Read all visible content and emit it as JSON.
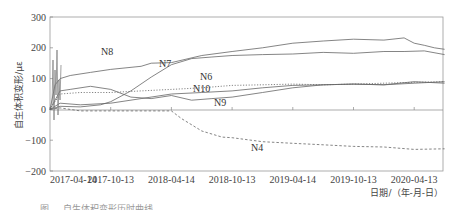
{
  "chart_data": {
    "type": "line",
    "title": "",
    "xlabel": "日期/（年-月-日）",
    "ylabel": "自生体积变形/με",
    "ylim": [
      -200,
      300
    ],
    "yticks": [
      300,
      200,
      100,
      0,
      -100,
      -200
    ],
    "xticks": [
      "2017-04-14",
      "2017-10-13",
      "2018-04-14",
      "2018-10-13",
      "2019-04-14",
      "2019-10-13",
      "2020-04-13"
    ],
    "grid": false,
    "legend": "inline labels",
    "x_unit": "months since 2017-04-14",
    "series": [
      {
        "name": "N8",
        "style": "solid",
        "x": [
          0,
          0.5,
          1,
          2,
          4,
          6,
          9,
          10,
          12,
          15,
          18,
          21,
          24,
          27,
          30,
          33,
          35,
          36,
          37,
          38,
          39
        ],
        "values": [
          0,
          80,
          100,
          110,
          120,
          130,
          140,
          150,
          152,
          175,
          188,
          200,
          215,
          222,
          228,
          225,
          232,
          215,
          208,
          200,
          195
        ]
      },
      {
        "name": "N7",
        "style": "solid",
        "x": [
          0,
          1,
          3,
          5,
          6,
          8,
          10,
          12,
          14,
          16,
          18,
          21,
          24,
          27,
          30,
          33,
          35,
          37,
          39
        ],
        "values": [
          0,
          10,
          8,
          15,
          25,
          60,
          105,
          145,
          165,
          170,
          175,
          178,
          180,
          185,
          182,
          188,
          188,
          190,
          178
        ]
      },
      {
        "name": "N6",
        "style": "dotted",
        "x": [
          0,
          1,
          3,
          6,
          9,
          12,
          15,
          18,
          21,
          24,
          27,
          30,
          33,
          36,
          39
        ],
        "values": [
          0,
          50,
          55,
          55,
          60,
          65,
          70,
          78,
          80,
          82,
          80,
          82,
          85,
          88,
          90
        ]
      },
      {
        "name": "N10",
        "style": "solid",
        "x": [
          0,
          1,
          2,
          4,
          6,
          8,
          10,
          12,
          14,
          16,
          18,
          21,
          24,
          27,
          30,
          33,
          36,
          39
        ],
        "values": [
          0,
          60,
          65,
          75,
          65,
          40,
          35,
          45,
          30,
          35,
          40,
          55,
          70,
          80,
          82,
          80,
          90,
          85
        ]
      },
      {
        "name": "N9",
        "style": "solid",
        "x": [
          0,
          1,
          3,
          6,
          9,
          12,
          15,
          18,
          21,
          24,
          27,
          30,
          33,
          36,
          39
        ],
        "values": [
          0,
          20,
          15,
          20,
          35,
          50,
          55,
          60,
          70,
          78,
          80,
          82,
          80,
          85,
          90
        ]
      },
      {
        "name": "N4",
        "style": "dashed",
        "x": [
          0,
          1,
          3,
          6,
          9,
          12,
          13,
          15,
          17,
          18,
          21,
          24,
          27,
          30,
          33,
          36,
          39
        ],
        "values": [
          0,
          5,
          -5,
          -5,
          -5,
          -5,
          -30,
          -70,
          -90,
          -92,
          -105,
          -110,
          -115,
          -120,
          -122,
          -130,
          -128
        ]
      }
    ],
    "annotations": [
      {
        "text": "N8",
        "x": 101,
        "y": 55
      },
      {
        "text": "N7",
        "x": 159,
        "y": 67
      },
      {
        "text": "N6",
        "x": 200,
        "y": 80
      },
      {
        "text": "N10",
        "x": 193,
        "y": 92
      },
      {
        "text": "N9",
        "x": 214,
        "y": 106
      },
      {
        "text": "N4",
        "x": 251,
        "y": 151
      }
    ]
  },
  "caption": "图 ... 自生体积变形历时曲线"
}
